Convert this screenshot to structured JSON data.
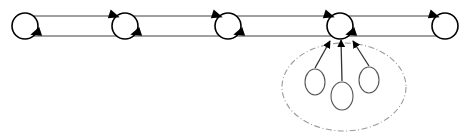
{
  "diagram": {
    "type": "node-link-diagram",
    "canvas": {
      "width": 467,
      "height": 137,
      "background": "#ffffff"
    },
    "colors": {
      "node_stroke": "#000000",
      "node_fill": "#ffffff",
      "edge_line": "#808080",
      "arrowhead": "#000000",
      "cluster_border": "#9a9a9a",
      "cluster_fill": "#ffffff",
      "sub_node_stroke": "#555555",
      "sub_edge": "#333333"
    },
    "chain": {
      "label": "main-chain",
      "node_radius": 13,
      "top_track_y": 16,
      "bottom_track_y": 36,
      "nodes": [
        {
          "id": "n1",
          "label": "",
          "cx": 25,
          "cy": 26,
          "arrow_top": false,
          "arrow_bottom": true
        },
        {
          "id": "n2",
          "label": "",
          "cx": 125,
          "cy": 26,
          "arrow_top": true,
          "arrow_bottom": true
        },
        {
          "id": "n3",
          "label": "",
          "cx": 228,
          "cy": 26,
          "arrow_top": true,
          "arrow_bottom": true
        },
        {
          "id": "n4",
          "label": "",
          "cx": 340,
          "cy": 26,
          "arrow_top": true,
          "arrow_bottom": true
        },
        {
          "id": "n5",
          "label": "",
          "cx": 445,
          "cy": 26,
          "arrow_top": true,
          "arrow_bottom": false
        }
      ],
      "top_edge_direction": "left-to-right",
      "bottom_edge_direction": "right-to-left"
    },
    "cluster": {
      "label": "expanded-cluster",
      "border_style": "dash-dot",
      "cx": 344,
      "cy": 87,
      "rx": 62,
      "ry": 44,
      "attached_to_node": "n4",
      "sub_nodes": [
        {
          "id": "s1",
          "label": "",
          "cx": 315,
          "cy": 82,
          "rx": 10,
          "ry": 13
        },
        {
          "id": "s2",
          "label": "",
          "cx": 342,
          "cy": 96,
          "rx": 11,
          "ry": 14
        },
        {
          "id": "s3",
          "label": "",
          "cx": 369,
          "cy": 80,
          "rx": 10,
          "ry": 13
        }
      ],
      "sub_edges": [
        {
          "from": "s1",
          "to": "n4",
          "target_x": 330,
          "target_y": 41
        },
        {
          "from": "s2",
          "to": "n4",
          "target_x": 341,
          "target_y": 40
        },
        {
          "from": "s3",
          "to": "n4",
          "target_x": 353,
          "target_y": 41
        }
      ]
    }
  }
}
